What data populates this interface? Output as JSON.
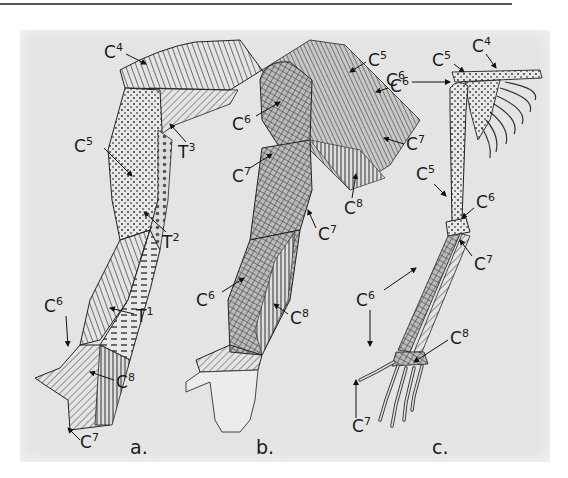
{
  "figure": {
    "panels": [
      {
        "id": "a",
        "caption": "a.",
        "subject": "skin (dermatomes)",
        "labels": [
          {
            "text": "C",
            "sup": "4"
          },
          {
            "text": "T",
            "sup": "3"
          },
          {
            "text": "C",
            "sup": "5"
          },
          {
            "text": "T",
            "sup": "2"
          },
          {
            "text": "T",
            "sup": "1"
          },
          {
            "text": "C",
            "sup": "6"
          },
          {
            "text": "C",
            "sup": "8"
          },
          {
            "text": "C",
            "sup": "7"
          }
        ]
      },
      {
        "id": "b",
        "caption": "b.",
        "subject": "muscles (myotomes)",
        "labels": [
          {
            "text": "C",
            "sup": "5"
          },
          {
            "text": "C",
            "sup": "6"
          },
          {
            "text": "C",
            "sup": "6"
          },
          {
            "text": "C",
            "sup": "7"
          },
          {
            "text": "C",
            "sup": "7"
          },
          {
            "text": "C",
            "sup": "8"
          },
          {
            "text": "C",
            "sup": "7"
          },
          {
            "text": "C",
            "sup": "6"
          },
          {
            "text": "C",
            "sup": "8"
          }
        ]
      },
      {
        "id": "c",
        "caption": "c.",
        "subject": "bones (sclerotomes)",
        "labels": [
          {
            "text": "C",
            "sup": "4"
          },
          {
            "text": "C",
            "sup": "5"
          },
          {
            "text": "C",
            "sup": "6"
          },
          {
            "text": "C",
            "sup": "5"
          },
          {
            "text": "C",
            "sup": "6"
          },
          {
            "text": "C",
            "sup": "7"
          },
          {
            "text": "C",
            "sup": "6"
          },
          {
            "text": "C",
            "sup": "8"
          },
          {
            "text": "C",
            "sup": "7"
          }
        ]
      }
    ]
  },
  "colors": {
    "background": "#e4e4e4",
    "ink": "#1a1a1a",
    "rule": "#555555"
  }
}
